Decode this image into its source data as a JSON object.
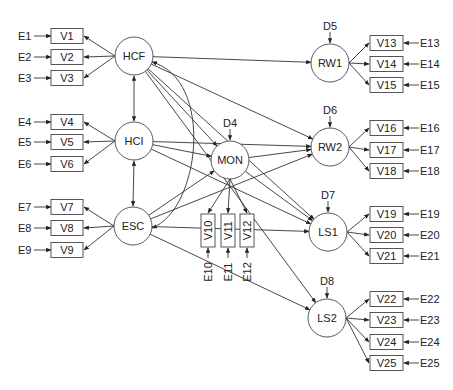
{
  "diagram": {
    "type": "structural-equation-model",
    "latent": [
      {
        "id": "HCF",
        "label": "HCF",
        "cx": 134,
        "cy": 56,
        "r": 19
      },
      {
        "id": "HCI",
        "label": "HCI",
        "cx": 134,
        "cy": 141,
        "r": 19
      },
      {
        "id": "ESC",
        "label": "ESC",
        "cx": 133,
        "cy": 226,
        "r": 19
      },
      {
        "id": "MON",
        "label": "MON",
        "cx": 230,
        "cy": 160,
        "r": 19,
        "disturbance": "D4"
      },
      {
        "id": "RW1",
        "label": "RW1",
        "cx": 330,
        "cy": 63,
        "r": 19,
        "disturbance": "D5"
      },
      {
        "id": "RW2",
        "label": "RW2",
        "cx": 330,
        "cy": 147,
        "r": 19,
        "disturbance": "D6"
      },
      {
        "id": "LS1",
        "label": "LS1",
        "cx": 328,
        "cy": 232,
        "r": 19,
        "disturbance": "D7"
      },
      {
        "id": "LS2",
        "label": "LS2",
        "cx": 327,
        "cy": 318,
        "r": 19,
        "disturbance": "D8"
      }
    ],
    "left_indicators": [
      {
        "label": "V1",
        "error": "E1",
        "y": 36,
        "factor": "HCF"
      },
      {
        "label": "V2",
        "error": "E2",
        "y": 57,
        "factor": "HCF"
      },
      {
        "label": "V3",
        "error": "E3",
        "y": 78,
        "factor": "HCF"
      },
      {
        "label": "V4",
        "error": "E4",
        "y": 122,
        "factor": "HCI"
      },
      {
        "label": "V5",
        "error": "E5",
        "y": 142,
        "factor": "HCI"
      },
      {
        "label": "V6",
        "error": "E6",
        "y": 164,
        "factor": "HCI"
      },
      {
        "label": "V7",
        "error": "E7",
        "y": 207,
        "factor": "ESC"
      },
      {
        "label": "V8",
        "error": "E8",
        "y": 228,
        "factor": "ESC"
      },
      {
        "label": "V9",
        "error": "E9",
        "y": 250,
        "factor": "ESC"
      }
    ],
    "mid_indicators": [
      {
        "label": "V10",
        "error": "E10",
        "x": 208
      },
      {
        "label": "V11",
        "error": "E11",
        "x": 228
      },
      {
        "label": "V12",
        "error": "E12",
        "x": 247
      }
    ],
    "right_indicators": [
      {
        "label": "V13",
        "error": "E13",
        "y": 43,
        "factor": "RW1"
      },
      {
        "label": "V14",
        "error": "E14",
        "y": 64,
        "factor": "RW1"
      },
      {
        "label": "V15",
        "error": "E15",
        "y": 85,
        "factor": "RW1"
      },
      {
        "label": "V16",
        "error": "E16",
        "y": 128,
        "factor": "RW2"
      },
      {
        "label": "V17",
        "error": "E17",
        "y": 150,
        "factor": "RW2"
      },
      {
        "label": "V18",
        "error": "E18",
        "y": 171,
        "factor": "RW2"
      },
      {
        "label": "V19",
        "error": "E19",
        "y": 214,
        "factor": "LS1"
      },
      {
        "label": "V20",
        "error": "E20",
        "y": 235,
        "factor": "LS1"
      },
      {
        "label": "V21",
        "error": "E21",
        "y": 256,
        "factor": "LS1"
      },
      {
        "label": "V22",
        "error": "E22",
        "y": 299,
        "factor": "LS2"
      },
      {
        "label": "V23",
        "error": "E23",
        "y": 320,
        "factor": "LS2"
      },
      {
        "label": "V24",
        "error": "E24",
        "y": 342,
        "factor": "LS2"
      },
      {
        "label": "V25",
        "error": "E25",
        "y": 363,
        "factor": "LS2"
      }
    ],
    "covariances": [
      [
        "HCF",
        "HCI"
      ],
      [
        "HCI",
        "ESC"
      ],
      [
        "HCF",
        "ESC"
      ]
    ],
    "paths": [
      [
        "HCF",
        "RW1"
      ],
      [
        "HCF",
        "RW2"
      ],
      [
        "HCF",
        "MON"
      ],
      [
        "HCF",
        "LS1"
      ],
      [
        "HCF",
        "LS2"
      ],
      [
        "HCI",
        "MON"
      ],
      [
        "HCI",
        "LS1"
      ],
      [
        "HCI",
        "RW2"
      ],
      [
        "ESC",
        "MON"
      ],
      [
        "ESC",
        "LS1"
      ],
      [
        "ESC",
        "LS2"
      ],
      [
        "ESC",
        "RW2"
      ],
      [
        "MON",
        "RW2"
      ],
      [
        "MON",
        "LS1"
      ]
    ]
  }
}
